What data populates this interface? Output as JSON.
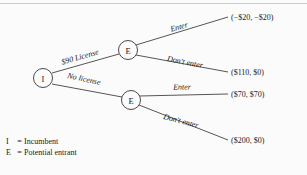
{
  "figure": {
    "type": "extensive-form-game-tree",
    "background_color": "#fbfbfb",
    "line_color": "#2b2b2b"
  },
  "nodes": [
    {
      "id": "root",
      "label": "I",
      "player": "Incumbent",
      "x": 43,
      "y": 78,
      "r": 9.5
    },
    {
      "id": "e_top",
      "label": "E",
      "player": "Potential entrant",
      "x": 128,
      "y": 50,
      "r": 9.5
    },
    {
      "id": "e_bottom",
      "label": "E",
      "player": "Potential entrant",
      "x": 131,
      "y": 100,
      "r": 9.5
    }
  ],
  "branches": [
    {
      "id": "license",
      "label": "$90 License",
      "from": "root",
      "to": "e_top",
      "label_x": 80,
      "label_y": 57,
      "rotate": -20
    },
    {
      "id": "no_license",
      "label": "No license",
      "from": "root",
      "to": "e_bottom",
      "label_x": 83,
      "label_y": 78,
      "rotate": 16
    },
    {
      "id": "enter_top",
      "label": "Enter",
      "from": "e_top",
      "to": "payoff_1",
      "label_x": 179,
      "label_y": 29,
      "rotate": -15
    },
    {
      "id": "dont_enter_top",
      "label": "Don't enter",
      "from": "e_top",
      "to": "payoff_2",
      "label_x": 185,
      "label_y": 64,
      "rotate": 10
    },
    {
      "id": "enter_bottom",
      "label": "Enter",
      "from": "e_bottom",
      "to": "payoff_3",
      "label_x": 182,
      "label_y": 88,
      "rotate": 0
    },
    {
      "id": "dont_enter_bottom",
      "label": "Don't enter",
      "from": "e_bottom",
      "to": "payoff_4",
      "label_x": 182,
      "label_y": 123,
      "rotate": 15
    }
  ],
  "payoffs": [
    {
      "id": "payoff_1",
      "text": "(−$20, −$20)",
      "incumbent": "-$20",
      "entrant": "-$20",
      "x": 231,
      "y": 17
    },
    {
      "id": "payoff_2",
      "text": "($110, $0)",
      "incumbent": "$110",
      "entrant": "$0",
      "x": 231,
      "y": 72
    },
    {
      "id": "payoff_3",
      "text": "($70, $70)",
      "incumbent": "$70",
      "entrant": "$70",
      "x": 231,
      "y": 94
    },
    {
      "id": "payoff_4",
      "text": "($200, $0)",
      "incumbent": "$200",
      "entrant": "$0",
      "x": 231,
      "y": 140
    }
  ],
  "legend": {
    "rows": [
      {
        "key": "I",
        "eq": "=",
        "value": "Incumbent"
      },
      {
        "key": "E",
        "eq": "=",
        "value": "Potential entrant"
      }
    ]
  }
}
